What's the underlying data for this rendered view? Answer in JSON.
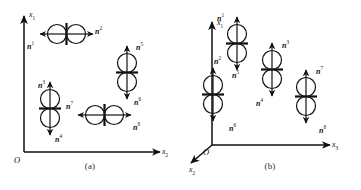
{
  "figure": {
    "background": "#ffffff",
    "stroke_color": "#111111",
    "panels": [
      {
        "id": "a",
        "caption": "(a)",
        "type": "2d-cartesian",
        "axes": [
          {
            "name": "vertical-axis",
            "label": "x",
            "subscript": "1",
            "direction": "up"
          },
          {
            "name": "horizontal-axis",
            "label": "x",
            "subscript": "2",
            "direction": "right"
          }
        ],
        "origin_label": "O",
        "dipoles": [
          {
            "id": "dipole-a-1",
            "orientation": "horizontal",
            "labels": [
              {
                "base": "n",
                "superscript": "1",
                "arrow": "left"
              },
              {
                "base": "n",
                "superscript": "2",
                "arrow": "right"
              }
            ]
          },
          {
            "id": "dipole-a-2",
            "orientation": "vertical",
            "labels": [
              {
                "base": "n",
                "superscript": "5",
                "arrow": "up"
              },
              {
                "base": "n",
                "superscript": "6",
                "arrow": "down"
              }
            ]
          },
          {
            "id": "dipole-a-3",
            "orientation": "vertical",
            "labels": [
              {
                "base": "n",
                "superscript": "3",
                "arrow": "up"
              },
              {
                "base": "n",
                "superscript": "4",
                "arrow": "down"
              }
            ]
          },
          {
            "id": "dipole-a-4",
            "orientation": "horizontal",
            "labels": [
              {
                "base": "n",
                "superscript": "7",
                "arrow": "left"
              },
              {
                "base": "n",
                "superscript": "8",
                "arrow": "right"
              }
            ]
          }
        ]
      },
      {
        "id": "b",
        "caption": "(b)",
        "type": "3d-cartesian",
        "axes": [
          {
            "name": "vertical-axis",
            "label": "x",
            "subscript": "1",
            "direction": "up"
          },
          {
            "name": "depth-axis",
            "label": "x",
            "subscript": "2",
            "direction": "down-left"
          },
          {
            "name": "horizontal-axis",
            "label": "x",
            "subscript": "3",
            "direction": "right"
          }
        ],
        "origin_label": "O",
        "dipoles": [
          {
            "id": "dipole-b-1",
            "orientation": "vertical",
            "labels": [
              {
                "base": "n",
                "superscript": "1",
                "arrow": "up"
              },
              {
                "base": "n",
                "superscript": "2",
                "arrow": "down"
              }
            ]
          },
          {
            "id": "dipole-b-2",
            "orientation": "vertical",
            "labels": [
              {
                "base": "n",
                "superscript": "3",
                "arrow": "up"
              },
              {
                "base": "n",
                "superscript": "4",
                "arrow": "down"
              }
            ]
          },
          {
            "id": "dipole-b-3",
            "orientation": "vertical",
            "labels": [
              {
                "base": "n",
                "superscript": "5",
                "arrow": "up"
              },
              {
                "base": "n",
                "superscript": "6",
                "arrow": "down"
              }
            ]
          },
          {
            "id": "dipole-b-4",
            "orientation": "vertical",
            "labels": [
              {
                "base": "n",
                "superscript": "7",
                "arrow": "up"
              },
              {
                "base": "n",
                "superscript": "8",
                "arrow": "down"
              }
            ]
          }
        ]
      }
    ]
  }
}
